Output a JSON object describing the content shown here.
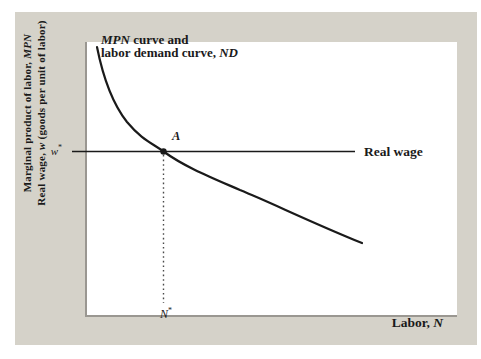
{
  "colors": {
    "panel_bg": "#d5d2c9",
    "plot_bg": "#ffffff",
    "axis": "#9a9791",
    "ink": "#1a1a1a",
    "dotted": "#4a4a4a"
  },
  "labels": {
    "y_line1_pre": "Marginal product of labor, ",
    "y_line1_em": "MPN",
    "y_line2_pre": "Real wage, ",
    "y_line2_em": "w",
    "y_line2_post": " (goods per unit of labor)",
    "c_line1_em": "MPN",
    "c_line1_post": " curve and",
    "c_line2_pre": "labor demand curve, ",
    "c_line2_em": "ND",
    "real_wage": "Real wage",
    "point_a": "A",
    "w_base": "w",
    "w_sup": "*",
    "n_base": "N",
    "n_sup": "*",
    "x_pre": "Labor, ",
    "x_em": "N"
  },
  "chart_data": {
    "type": "line",
    "qualitative": true,
    "title": "",
    "xlabel": "Labor, N",
    "ylabel": "Marginal product of labor, MPN / Real wage, w (goods per unit of labor)",
    "axes": {
      "numeric_ticks": false,
      "x_tick_labels": [
        "N*"
      ],
      "y_tick_labels": [
        "w*"
      ],
      "grid": false
    },
    "series": [
      {
        "name": "MPN curve and labor demand curve, ND",
        "kind": "curve",
        "shape": "downward-sloping convex (diminishing marginal product of labor)",
        "points_px": [
          [
            97,
            47
          ],
          [
            112,
            103
          ],
          [
            127,
            122
          ],
          [
            163,
            151
          ],
          [
            210,
            177
          ],
          [
            240,
            190
          ],
          [
            305,
            220
          ],
          [
            362,
            243
          ]
        ]
      },
      {
        "name": "Real wage",
        "kind": "horizontal-line",
        "y_px": 151.5,
        "x_span_px": [
          72,
          355
        ]
      }
    ],
    "equilibrium": {
      "label": "A",
      "x_px": 163.5,
      "y_px": 151.5,
      "x_axis_mark": "N*",
      "y_axis_mark": "w*"
    },
    "geometry": {
      "curve_d": "M 97 47 C 103 77 112 103 127 122 C 142 140 152 143 163.5 151.5 C 185 167 210 177 240 190 C 272 203 308 221 362 243",
      "curve_width": 2.2,
      "wage_line": {
        "x1": 72,
        "x2": 355,
        "y": 151.5,
        "width": 1.5
      },
      "dotted": {
        "x": 163.5,
        "y1": 155,
        "y2": 303,
        "width": 1.4,
        "dash": "1.6 3"
      },
      "point": {
        "cx": 163.5,
        "cy": 151.5,
        "r": 3.2
      }
    }
  }
}
